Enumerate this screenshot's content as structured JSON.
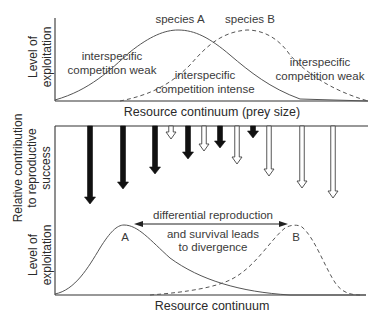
{
  "top_panel": {
    "ylabel_line1": "Level of",
    "ylabel_line2": "exploitation",
    "xlabel": "Resource continuum (prey size)",
    "species_a_label": "species A",
    "species_b_label": "species B",
    "left_annotation_line1": "interspecific",
    "left_annotation_line2": "competition weak",
    "middle_annotation_line1": "interspecific",
    "middle_annotation_line2": "competition intense",
    "right_annotation_line1": "interspecific",
    "right_annotation_line2": "competition weak"
  },
  "middle_panel": {
    "ylabel_line1": "Relative contribution",
    "ylabel_line2": "to reproductive",
    "ylabel_line3": "success",
    "arrows": [
      {
        "x": 90,
        "length": 78,
        "fill": "black"
      },
      {
        "x": 123,
        "length": 63,
        "fill": "black"
      },
      {
        "x": 155,
        "length": 48,
        "fill": "black"
      },
      {
        "x": 171,
        "length": 13,
        "fill": "white"
      },
      {
        "x": 188,
        "length": 33,
        "fill": "black"
      },
      {
        "x": 204,
        "length": 25,
        "fill": "white"
      },
      {
        "x": 220,
        "length": 22,
        "fill": "black"
      },
      {
        "x": 237,
        "length": 38,
        "fill": "white"
      },
      {
        "x": 253,
        "length": 12,
        "fill": "black"
      },
      {
        "x": 269,
        "length": 50,
        "fill": "white"
      },
      {
        "x": 302,
        "length": 62,
        "fill": "white"
      },
      {
        "x": 333,
        "length": 72,
        "fill": "white"
      }
    ],
    "arrow_legend": {
      "black": "species A",
      "white": "species B"
    }
  },
  "bottom_panel": {
    "ylabel_line1": "Level of",
    "ylabel_line2": "exploitation",
    "xlabel": "Resource continuum",
    "curve_a_label": "A",
    "curve_b_label": "B",
    "annotation_line1": "differential reproduction",
    "annotation_line2": "and survival leads",
    "annotation_line3": "to divergence"
  }
}
